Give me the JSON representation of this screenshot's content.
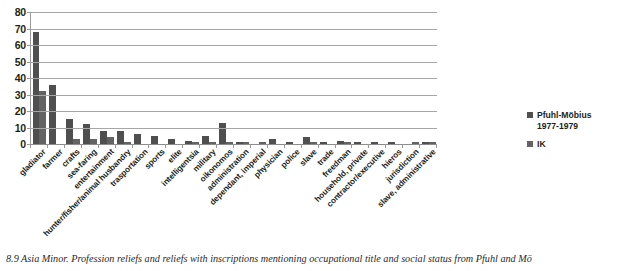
{
  "chart_data": {
    "type": "bar",
    "title": "",
    "xlabel": "",
    "ylabel": "",
    "ylim": [
      0,
      80
    ],
    "yticks": [
      0,
      10,
      20,
      30,
      40,
      50,
      60,
      70,
      80
    ],
    "grid": true,
    "legend_position": "right",
    "categories": [
      "gladiator",
      "farmer",
      "crafts",
      "sea-faring",
      "entertainment",
      "hunter/fisher/animal husbandry",
      "trasportation",
      "sports",
      "elite",
      "intelligentsia",
      "military",
      "oikonomos",
      "administration",
      "dependant, imperial",
      "physician",
      "police",
      "slave",
      "trade",
      "freedman",
      "household, private",
      "contractor/executive",
      "hieros",
      "jurisdiction",
      "slave, administrative"
    ],
    "series": [
      {
        "name": "Pfuhl-Möbius 1977-1979",
        "color": "#4f4f4f",
        "values": [
          68,
          36,
          15,
          12,
          8,
          8,
          6,
          5,
          3,
          2,
          5,
          13,
          1,
          0,
          3,
          1,
          4,
          1,
          2,
          1,
          1,
          1,
          0,
          1
        ]
      },
      {
        "name": "IK",
        "color": "#636363",
        "values": [
          32,
          0,
          3,
          3,
          4,
          1,
          0,
          0,
          0,
          1,
          1,
          1,
          1,
          1,
          0,
          0,
          1,
          0,
          1,
          0,
          0,
          0,
          1,
          1
        ]
      }
    ]
  },
  "legend": {
    "items": [
      {
        "label": "Pfuhl-Möbius\n1977-1979",
        "swatch": "series1-swatch"
      },
      {
        "label": "IK",
        "swatch": "series2-swatch"
      }
    ]
  },
  "caption": {
    "number": "8.9",
    "text": "Asia Minor. Profession reliefs and reliefs with inscriptions mentioning occupational title and social status from Pfuhl and Mö"
  }
}
